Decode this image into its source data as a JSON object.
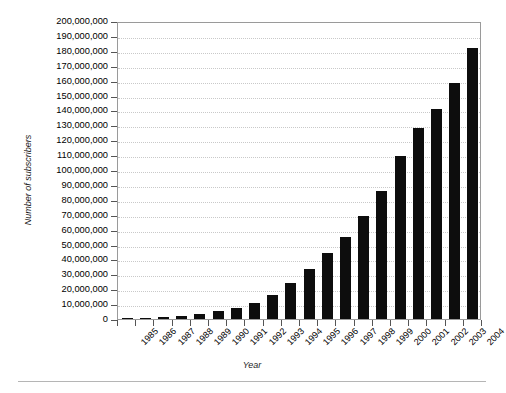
{
  "chart_data": {
    "type": "bar",
    "title": "",
    "xlabel": "Year",
    "ylabel": "Number of subscribers",
    "categories": [
      "1985",
      "1986",
      "1987",
      "1988",
      "1989",
      "1990",
      "1991",
      "1992",
      "1993",
      "1994",
      "1995",
      "1996",
      "1997",
      "1998",
      "1999",
      "2000",
      "2001",
      "2002",
      "2003",
      "2004"
    ],
    "values": [
      203000,
      682000,
      1231000,
      2069000,
      3509000,
      5283000,
      7557000,
      11033000,
      16009000,
      24134000,
      33786000,
      44043000,
      55312000,
      69209000,
      86047000,
      109478000,
      128500000,
      140767000,
      158722000,
      182140000
    ],
    "ylim": [
      0,
      200000000
    ],
    "ytick_values": [
      0,
      10000000,
      20000000,
      30000000,
      40000000,
      50000000,
      60000000,
      70000000,
      80000000,
      90000000,
      100000000,
      110000000,
      120000000,
      130000000,
      140000000,
      150000000,
      160000000,
      170000000,
      180000000,
      190000000,
      200000000
    ],
    "ytick_labels": [
      "0",
      "10,000,000",
      "20,000,000",
      "30,000,000",
      "40,000,000",
      "50,000,000",
      "60,000,000",
      "70,000,000",
      "80,000,000",
      "90,000,000",
      "100,000,000",
      "110,000,000",
      "120,000,000",
      "130,000,000",
      "140,000,000",
      "150,000,000",
      "160,000,000",
      "170,000,000",
      "180,000,000",
      "190,000,000",
      "200,000,000"
    ],
    "grid": true,
    "grid_axis": "y",
    "legend": null,
    "legend_position": "none",
    "bar_color": "#0d0d0d",
    "grid_color": "#c9c9c9",
    "frame_color": "#9a9a9a"
  }
}
